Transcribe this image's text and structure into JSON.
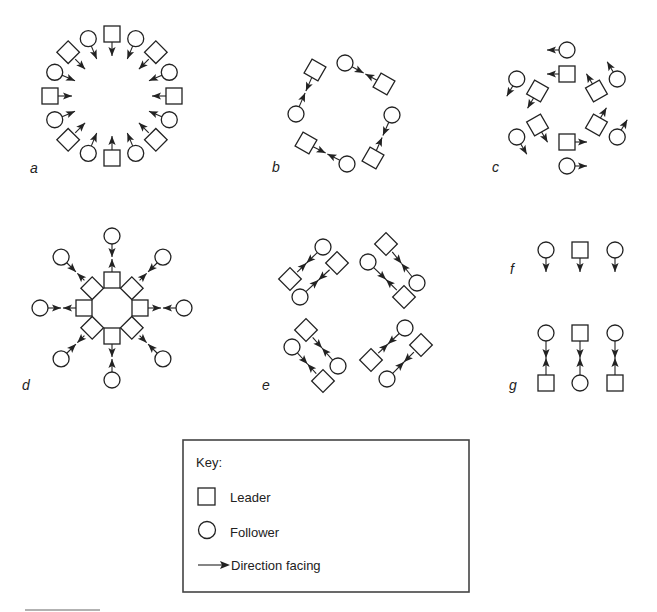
{
  "figure": {
    "panels": [
      {
        "id": "a",
        "label": "a",
        "description": "Ring of 16 dancers facing inward; leaders at cardinal and diagonal points, followers between"
      },
      {
        "id": "b",
        "label": "b",
        "description": "Four leader-follower couples arranged in a ring, partners facing each other"
      },
      {
        "id": "c",
        "label": "c",
        "description": "Six leaders in an inner ring, six followers outside, all facing counterclockwise"
      },
      {
        "id": "d",
        "label": "d",
        "description": "Eight leaders in a tight inner octagon, eight followers on spokes, partners facing each other"
      },
      {
        "id": "e",
        "label": "e",
        "description": "Four groups of two couples, partners facing each other diagonally"
      },
      {
        "id": "f",
        "label": "f",
        "description": "A single line of three dancers (follower, leader, follower) all facing the same direction"
      },
      {
        "id": "g",
        "label": "g",
        "description": "Two facing lines of three dancers, partners facing each other"
      }
    ],
    "panel_elements": {
      "a": {
        "leaders": 8,
        "followers": 8,
        "facing": "inward"
      },
      "b": {
        "leaders": 4,
        "followers": 4,
        "facing": "partner"
      },
      "c": {
        "leaders": 6,
        "followers": 6,
        "facing": "counterclockwise"
      },
      "d": {
        "leaders": 8,
        "followers": 8,
        "facing": "partner"
      },
      "e": {
        "leaders": 8,
        "followers": 8,
        "facing": "partner"
      },
      "f": {
        "leaders": 1,
        "followers": 2,
        "facing": "down"
      },
      "g": {
        "leaders": 3,
        "followers": 3,
        "facing": "partner"
      }
    }
  },
  "key": {
    "title": "Key:",
    "items": [
      {
        "symbol": "square",
        "label": "Leader"
      },
      {
        "symbol": "circle",
        "label": "Follower"
      },
      {
        "symbol": "arrow",
        "label": "Direction facing"
      }
    ]
  },
  "colors": {
    "stroke": "#222222",
    "background": "#ffffff"
  }
}
